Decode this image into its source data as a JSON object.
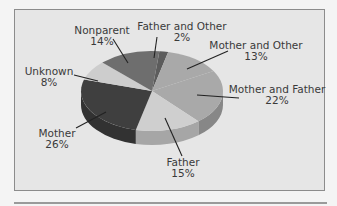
{
  "chart_data": {
    "type": "pie",
    "title": "",
    "three_d": true,
    "categories": [
      "Father and Other",
      "Mother and Other",
      "Mother and Father",
      "Father",
      "Mother",
      "Unknown",
      "Nonparent"
    ],
    "values": [
      2,
      13,
      22,
      15,
      26,
      8,
      14
    ],
    "value_labels": [
      "2%",
      "13%",
      "22%",
      "15%",
      "26%",
      "8%",
      "14%"
    ],
    "colors": [
      "#5c5c5c",
      "#a9a9a9",
      "#a9a9a9",
      "#cfcfcf",
      "#3f3f3f",
      "#cdcdcd",
      "#6e6e6e"
    ],
    "legend": "none (leader-line labels)"
  },
  "labels": {
    "father_other": {
      "name": "Father and Other",
      "pct": "2%"
    },
    "mother_other": {
      "name": "Mother and Other",
      "pct": "13%"
    },
    "mother_father": {
      "name": "Mother and Father",
      "pct": "22%"
    },
    "father": {
      "name": "Father",
      "pct": "15%"
    },
    "mother": {
      "name": "Mother",
      "pct": "26%"
    },
    "unknown": {
      "name": "Unknown",
      "pct": "8%"
    },
    "nonparent": {
      "name": "Nonparent",
      "pct": "14%"
    }
  }
}
